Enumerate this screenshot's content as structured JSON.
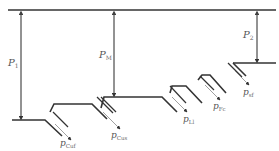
{
  "diagram": {
    "type": "pressure-profile",
    "colors": {
      "line": "#333333",
      "label": "#555555",
      "background": "#ffffff"
    },
    "top_line": {
      "label": ""
    },
    "pressure_differences": [
      {
        "id": "p1",
        "symbol": "P",
        "subscript": "1"
      },
      {
        "id": "pm",
        "symbol": "P",
        "subscript": "M"
      },
      {
        "id": "p2",
        "symbol": "P",
        "subscript": "2"
      }
    ],
    "stage_outputs": [
      {
        "id": "cuf",
        "symbol": "p",
        "subscript": "Cuf"
      },
      {
        "id": "cus",
        "symbol": "p",
        "subscript": "Cus"
      },
      {
        "id": "ll",
        "symbol": "p",
        "subscript": "Ll"
      },
      {
        "id": "fc",
        "symbol": "p",
        "subscript": "Fc"
      },
      {
        "id": "sf",
        "symbol": "p",
        "subscript": "sf"
      }
    ]
  }
}
